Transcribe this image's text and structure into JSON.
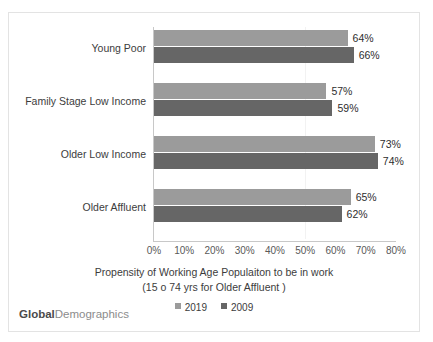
{
  "chart_data": {
    "type": "bar",
    "orientation": "horizontal",
    "title": "",
    "xlabel": "Propensity of Working Age Populaiton to be in work",
    "xlabel_line2": "(15 o 74 yrs for Older Affluent )",
    "ylabel": "",
    "xlim": [
      0,
      80
    ],
    "xtick_labels": [
      "0%",
      "10%",
      "20%",
      "30%",
      "40%",
      "50%",
      "60%",
      "70%",
      "80%"
    ],
    "xtick_values": [
      0,
      10,
      20,
      30,
      40,
      50,
      60,
      70,
      80
    ],
    "grid": true,
    "gridline_values": [
      50
    ],
    "legend_position": "bottom",
    "categories": [
      "Young Poor",
      "Family Stage Low Income",
      "Older Low Income",
      "Older Affluent"
    ],
    "series": [
      {
        "name": "2019",
        "color": "#9b9b9b",
        "values": [
          64,
          66,
          73,
          65
        ],
        "labels": [
          "64%",
          "57%",
          "73%",
          "65%"
        ]
      },
      {
        "name": "2009",
        "color": "#666666",
        "values": [
          66,
          59,
          74,
          62
        ],
        "labels": [
          "66%",
          "59%",
          "74%",
          "62%"
        ]
      }
    ],
    "bars": [
      {
        "category": "Young Poor",
        "v2019": 64,
        "l2019": "64%",
        "v2009": 66,
        "l2009": "66%"
      },
      {
        "category": "Family Stage Low Income",
        "v2019": 57,
        "l2019": "57%",
        "v2009": 59,
        "l2009": "59%"
      },
      {
        "category": "Older Low Income",
        "v2019": 73,
        "l2019": "73%",
        "v2009": 74,
        "l2009": "74%"
      },
      {
        "category": "Older Affluent",
        "v2019": 65,
        "l2019": "65%",
        "v2009": 62,
        "l2009": "62%"
      }
    ]
  },
  "legend": {
    "items": [
      {
        "label": "2019",
        "color": "#9b9b9b"
      },
      {
        "label": "2009",
        "color": "#666666"
      }
    ]
  },
  "watermark": {
    "bold_part": "Global",
    "light_part": "Demographics"
  },
  "colors": {
    "series_2019": "#9b9b9b",
    "series_2009": "#666666",
    "border": "#e3e3e3",
    "axis": "#c8c8c8",
    "gridline": "#f2f2f2",
    "text": "#3c3c3c"
  }
}
